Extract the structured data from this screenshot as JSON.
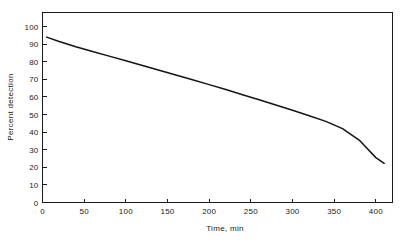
{
  "chart_data": {
    "type": "line",
    "title": "",
    "xlabel": "Time, min",
    "ylabel": "Percent detection",
    "xlim": [
      0,
      420
    ],
    "ylim": [
      0,
      108
    ],
    "grid": false,
    "legend": null,
    "x_ticks": [
      0,
      50,
      100,
      150,
      200,
      250,
      300,
      350,
      400
    ],
    "x_tick_labels": [
      "0",
      "50",
      "100",
      "150",
      "200",
      "250",
      "300",
      "350",
      "400"
    ],
    "y_ticks": [
      0,
      10,
      20,
      30,
      40,
      50,
      60,
      70,
      80,
      90,
      100
    ],
    "y_tick_labels": [
      "0",
      "10",
      "20",
      "30",
      "40",
      "50",
      "60",
      "70",
      "80",
      "90",
      "100"
    ],
    "series": [
      {
        "name": "Percent detection",
        "color": "#141414",
        "x": [
          5,
          20,
          40,
          60,
          80,
          100,
          120,
          140,
          160,
          180,
          200,
          220,
          240,
          260,
          280,
          300,
          320,
          340,
          360,
          380,
          400,
          410
        ],
        "y": [
          94,
          91.5,
          88.5,
          85.8,
          83.2,
          80.6,
          77.9,
          75.2,
          72.5,
          69.8,
          67.0,
          64.2,
          61.3,
          58.4,
          55.4,
          52.4,
          49.3,
          46.1,
          42.0,
          35.5,
          25.5,
          22.3
        ]
      }
    ]
  },
  "axis_titles": {
    "x": "Time, min",
    "y": "Percent detection"
  }
}
